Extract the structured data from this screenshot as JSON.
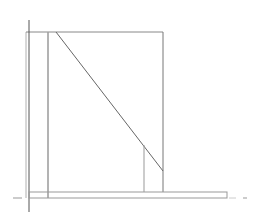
{
  "canvas": {
    "width": 262,
    "height": 224,
    "background": "#ffffff"
  },
  "colors": {
    "dark_line": "#555555",
    "mid_line": "#888888",
    "light_line": "#b0b0b0",
    "dash": "#999999"
  },
  "diagram": {
    "type": "line-drawing",
    "elements": [
      {
        "id": "axis-vertical",
        "x1": 29,
        "y1": 20,
        "x2": 29,
        "y2": 212
      },
      {
        "id": "outer-left-edge",
        "x1": 26,
        "y1": 32,
        "x2": 26,
        "y2": 198
      },
      {
        "id": "top-edge",
        "x1": 26,
        "y1": 32,
        "x2": 163,
        "y2": 32
      },
      {
        "id": "right-edge",
        "x1": 163,
        "y1": 32,
        "x2": 163,
        "y2": 192
      },
      {
        "id": "inner-left-post",
        "x1": 48,
        "y1": 32,
        "x2": 48,
        "y2": 198
      },
      {
        "id": "diagonal",
        "x1": 56,
        "y1": 32,
        "x2": 163,
        "y2": 171
      },
      {
        "id": "inner-vertical",
        "x1": 144,
        "y1": 145,
        "x2": 144,
        "y2": 192
      },
      {
        "id": "base-rect",
        "x": 29,
        "y": 192,
        "w": 198,
        "h": 6
      },
      {
        "id": "left-dash",
        "x1": 13,
        "y1": 198,
        "x2": 22,
        "y2": 198
      },
      {
        "id": "right-dash-1",
        "x1": 229,
        "y1": 198,
        "x2": 236,
        "y2": 198
      },
      {
        "id": "right-dash-2",
        "x1": 243,
        "y1": 198,
        "x2": 247,
        "y2": 198
      }
    ]
  }
}
